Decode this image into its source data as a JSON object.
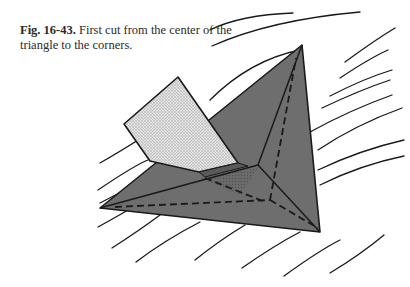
{
  "caption": {
    "label": "Fig. 16-43.",
    "text": " First cut from the center of the triangle to the corners."
  },
  "figure": {
    "colors": {
      "triangle_fill": "#6e6e6e",
      "flap_fill": "#d8d8d8",
      "under_flap_fill": "#5c5c5c",
      "line": "#1a1a1a",
      "background": "#ffffff"
    }
  }
}
